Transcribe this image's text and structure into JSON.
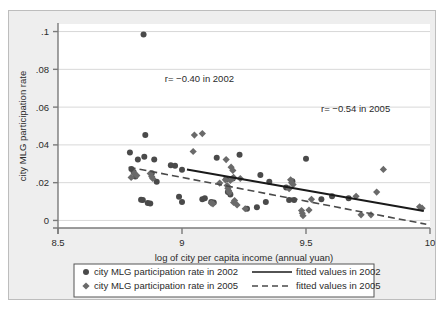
{
  "chart_data": {
    "type": "scatter",
    "title": "",
    "xlabel": "log of city per capita income (annual yuan)",
    "ylabel": "city MLG participation rate",
    "xlim": [
      8.5,
      10.0
    ],
    "ylim": [
      -0.004,
      0.104
    ],
    "xticks": [
      "8.5",
      "9",
      "9.5",
      "10"
    ],
    "xtick_values": [
      8.5,
      9,
      9.5,
      10
    ],
    "yticks": [
      "0",
      ".02",
      ".04",
      ".06",
      ".08",
      ".1"
    ],
    "ytick_values": [
      0,
      0.02,
      0.04,
      0.06,
      0.08,
      0.1
    ],
    "grid": "horizontal",
    "legend_position": "below-plot",
    "annotations": [
      {
        "text": "r= −0.40 in 2002",
        "x": 9.07,
        "y": 0.0735
      },
      {
        "text": "r= −0.54 in 2005",
        "x": 9.7,
        "y": 0.0572
      }
    ],
    "series": [
      {
        "name": "city MLG participation rate in 2002",
        "marker": "circle",
        "color": "#4a4a4a",
        "points": [
          [
            8.845,
            0.0985
          ],
          [
            8.852,
            0.0452
          ],
          [
            8.79,
            0.036
          ],
          [
            8.822,
            0.0322
          ],
          [
            8.848,
            0.0337
          ],
          [
            8.888,
            0.0322
          ],
          [
            8.796,
            0.0272
          ],
          [
            8.805,
            0.0256
          ],
          [
            8.812,
            0.0232
          ],
          [
            8.878,
            0.025
          ],
          [
            8.898,
            0.0205
          ],
          [
            8.955,
            0.0292
          ],
          [
            8.972,
            0.029
          ],
          [
            9.0,
            0.0268
          ],
          [
            9.14,
            0.0332
          ],
          [
            9.232,
            0.0348
          ],
          [
            9.316,
            0.024
          ],
          [
            9.352,
            0.0205
          ],
          [
            9.42,
            0.0175
          ],
          [
            9.445,
            0.0208
          ],
          [
            9.5,
            0.0327
          ],
          [
            9.562,
            0.0112
          ],
          [
            9.605,
            0.0128
          ],
          [
            9.672,
            0.0118
          ],
          [
            8.835,
            0.011
          ],
          [
            8.842,
            0.0108
          ],
          [
            8.862,
            0.0092
          ],
          [
            8.872,
            0.009
          ],
          [
            8.988,
            0.0125
          ],
          [
            9.0,
            0.0098
          ],
          [
            9.082,
            0.0112
          ],
          [
            9.092,
            0.0118
          ],
          [
            9.118,
            0.0098
          ],
          [
            9.128,
            0.0095
          ],
          [
            9.178,
            0.0218
          ],
          [
            9.205,
            0.0222
          ],
          [
            9.262,
            0.0062
          ],
          [
            9.302,
            0.007
          ],
          [
            9.338,
            0.0098
          ],
          [
            9.432,
            0.0108
          ],
          [
            9.452,
            0.0108
          ],
          [
            9.195,
            0.0138
          ],
          [
            9.185,
            0.015
          ]
        ]
      },
      {
        "name": "city MLG participation rate in 2005",
        "marker": "diamond",
        "color": "#6a6a6a",
        "points": [
          [
            9.05,
            0.0452
          ],
          [
            9.082,
            0.046
          ],
          [
            9.045,
            0.0365
          ],
          [
            9.178,
            0.0322
          ],
          [
            9.198,
            0.0282
          ],
          [
            9.205,
            0.0265
          ],
          [
            9.208,
            0.0228
          ],
          [
            9.195,
            0.0212
          ],
          [
            9.175,
            0.0215
          ],
          [
            9.182,
            0.0185
          ],
          [
            9.185,
            0.017
          ],
          [
            9.188,
            0.0158
          ],
          [
            9.192,
            0.0148
          ],
          [
            9.222,
            0.0082
          ],
          [
            9.208,
            0.0095
          ],
          [
            9.212,
            0.0105
          ],
          [
            9.118,
            0.0092
          ],
          [
            9.125,
            0.0088
          ],
          [
            9.255,
            0.0062
          ],
          [
            9.432,
            0.0168
          ],
          [
            9.438,
            0.0215
          ],
          [
            9.442,
            0.02
          ],
          [
            9.448,
            0.019
          ],
          [
            9.482,
            0.0052
          ],
          [
            9.485,
            0.0038
          ],
          [
            9.488,
            0.0025
          ],
          [
            9.512,
            0.0055
          ],
          [
            9.522,
            0.0112
          ],
          [
            9.702,
            0.0128
          ],
          [
            9.722,
            0.003
          ],
          [
            9.762,
            0.003
          ],
          [
            9.785,
            0.015
          ],
          [
            9.812,
            0.027
          ],
          [
            9.958,
            0.0072
          ],
          [
            9.968,
            0.0065
          ],
          [
            8.808,
            0.025
          ],
          [
            8.818,
            0.0238
          ],
          [
            8.872,
            0.0248
          ],
          [
            8.878,
            0.0232
          ],
          [
            8.882,
            0.0222
          ],
          [
            8.795,
            0.0228
          ],
          [
            9.235,
            0.0222
          ],
          [
            9.152,
            0.0198
          ]
        ]
      }
    ],
    "fits": [
      {
        "name": "fitted values in 2002",
        "style": "solid",
        "color": "#1a1a1a",
        "x0": 9.02,
        "y0": 0.027,
        "x1": 9.975,
        "y1": 0.005
      },
      {
        "name": "fitted values in 2005",
        "style": "dashed",
        "color": "#4a4a4a",
        "x0": 8.785,
        "y0": 0.0282,
        "x1": 9.985,
        "y1": -0.002
      }
    ]
  },
  "legend": {
    "entries": [
      {
        "marker": "circle",
        "label": "city MLG participation rate in 2002",
        "line": "solid",
        "line_label": "fitted values in 2002"
      },
      {
        "marker": "diamond",
        "label": "city MLG participation rate in 2005",
        "line": "dashed",
        "line_label": "fitted values in 2005"
      }
    ]
  },
  "colors": {
    "page_background": "#eeeeee",
    "plot_background": "#ffffff",
    "axis": "#7a7a7a",
    "grid": "#d8d8d8",
    "text": "#2b2b2b",
    "marker_2002": "#4a4a4a",
    "marker_2005": "#6a6a6a",
    "fit_2002": "#1a1a1a",
    "fit_2005": "#4a4a4a"
  }
}
